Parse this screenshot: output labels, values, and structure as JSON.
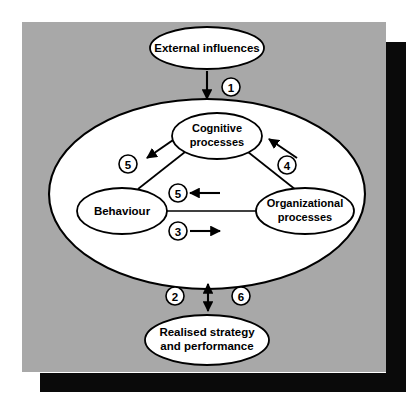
{
  "figure": {
    "background_color": "#ffffff",
    "panel_color": "#a8a8a8",
    "shadow_color": "#0a0a0a",
    "node_fill": "#ffffff",
    "stroke_color": "#000000"
  },
  "nodes": {
    "external": {
      "label": "External influences"
    },
    "cognitive": {
      "label_line1": "Cognitive",
      "label_line2": "processes"
    },
    "behaviour": {
      "label": "Behaviour"
    },
    "organizational": {
      "label_line1": "Organizational",
      "label_line2": "processes"
    },
    "realised": {
      "label_line1": "Realised strategy",
      "label_line2": "and performance"
    },
    "container": {
      "label": ""
    }
  },
  "markers": [
    {
      "id": "marker-1",
      "label": "1",
      "cx": 231,
      "cy": 87
    },
    {
      "id": "marker-5-upper-left",
      "label": "5",
      "cx": 128,
      "cy": 164
    },
    {
      "id": "marker-4",
      "label": "4",
      "cx": 287,
      "cy": 165
    },
    {
      "id": "marker-5-center",
      "label": "5",
      "cx": 178,
      "cy": 193
    },
    {
      "id": "marker-3",
      "label": "3",
      "cx": 178,
      "cy": 231
    },
    {
      "id": "marker-2",
      "label": "2",
      "cx": 175,
      "cy": 296
    },
    {
      "id": "marker-6",
      "label": "6",
      "cx": 241,
      "cy": 296
    }
  ],
  "arrows": [
    {
      "id": "arrow-external-to-container",
      "direction": "down",
      "marker": "1"
    },
    {
      "id": "arrow-cognitive-to-behaviour",
      "direction": "down-left",
      "marker": "5"
    },
    {
      "id": "arrow-organizational-to-cognitive",
      "direction": "up-left",
      "marker": "4"
    },
    {
      "id": "arrow-organizational-to-behaviour",
      "direction": "left",
      "marker": "5"
    },
    {
      "id": "arrow-behaviour-to-organizational",
      "direction": "right",
      "marker": "3"
    },
    {
      "id": "arrow-container-to-realised",
      "direction": "both",
      "marker": "2 / 6"
    }
  ],
  "connectors": [
    {
      "id": "connector-cognitive-behaviour"
    },
    {
      "id": "connector-cognitive-organizational"
    },
    {
      "id": "connector-behaviour-organizational"
    }
  ]
}
